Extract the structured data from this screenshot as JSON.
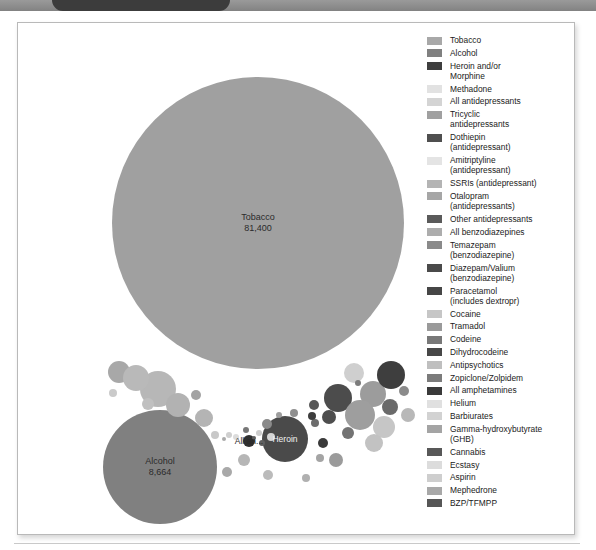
{
  "window": {
    "tab_name": "",
    "toolbar_color": "#8d8d8d",
    "tab_color": "#3c3c3c"
  },
  "figure": {
    "background": "#ffffff",
    "border_color": "#b9b9b9"
  },
  "chart_data": {
    "type": "bubble",
    "title": "",
    "subtitle": "",
    "xlabel": "",
    "ylabel": "",
    "grid": false,
    "legend_position": "right",
    "value_unit": "deaths",
    "labelled_bubbles": [
      {
        "name": "Tobacco",
        "value": 81400,
        "value_text": "81,400",
        "label_text": "Tobacco\n81,400"
      },
      {
        "name": "Alcohol",
        "value": 8664,
        "value_text": "8,664",
        "label_text": "Alcohol\n8,664"
      },
      {
        "name": "Heroin and/or Morphine",
        "value": null,
        "value_text": "",
        "label_text": "Heroin"
      },
      {
        "name": "All antidepressants",
        "value": null,
        "value_text": "",
        "label_text": "All an..."
      }
    ],
    "series": [
      {
        "name": "Tobacco",
        "value": 81400,
        "color": "#a0a0a0"
      },
      {
        "name": "Alcohol",
        "value": 8664,
        "color": "#808080"
      },
      {
        "name": "Heroin and/or Morphine",
        "value": null,
        "color": "#4a4a4a"
      },
      {
        "name": "Methadone",
        "value": null,
        "color": "#dcdcdc"
      },
      {
        "name": "All antidepressants",
        "value": null,
        "color": "#d2d2d2"
      },
      {
        "name": "Tricyclic antidepressants",
        "value": null,
        "color": "#9c9c9c"
      },
      {
        "name": "Dothiepin (antidepressant)",
        "value": null,
        "color": "#555555"
      },
      {
        "name": "Amitriptyline (antidepressant)",
        "value": null,
        "color": "#e0e0e0"
      },
      {
        "name": "SSRIs (antidepressant)",
        "value": null,
        "color": "#b0b0b0"
      },
      {
        "name": "Otalopram (antidepressants)",
        "value": null,
        "color": "#a8a8a8"
      },
      {
        "name": "Other antidepressants",
        "value": null,
        "color": "#5e5e5e"
      },
      {
        "name": "All benzodiazepines",
        "value": null,
        "color": "#a5a5a5"
      },
      {
        "name": "Temazepam (benzodiazepine)",
        "value": null,
        "color": "#8c8c8c"
      },
      {
        "name": "Diazepam/Valium (benzodiazepine)",
        "value": null,
        "color": "#4f4f4f"
      },
      {
        "name": "Paracetamol (includes dextropr)",
        "value": null,
        "color": "#4b4b4b"
      },
      {
        "name": "Cocaine",
        "value": null,
        "color": "#c4c4c4"
      },
      {
        "name": "Tramadol",
        "value": null,
        "color": "#9a9a9a"
      },
      {
        "name": "Codeine",
        "value": null,
        "color": "#7a7a7a"
      },
      {
        "name": "Dihydrocodeine",
        "value": null,
        "color": "#4d4d4d"
      },
      {
        "name": "Antipsychotics",
        "value": null,
        "color": "#bdbdbd"
      },
      {
        "name": "Zopiclone/Zolpidem",
        "value": null,
        "color": "#7e7e7e"
      },
      {
        "name": "All amphetamines",
        "value": null,
        "color": "#3f3f3f"
      },
      {
        "name": "Helium",
        "value": null,
        "color": "#dedede"
      },
      {
        "name": "Barbiurates",
        "value": null,
        "color": "#d0d0d0"
      },
      {
        "name": "Gamma-hydroxybutyrate (GHB)",
        "value": null,
        "color": "#a2a2a2"
      },
      {
        "name": "Cannabis",
        "value": null,
        "color": "#5c5c5c"
      },
      {
        "name": "Ecstasy",
        "value": null,
        "color": "#dadada"
      },
      {
        "name": "Aspirin",
        "value": null,
        "color": "#cccccc"
      },
      {
        "name": "Mephedrone",
        "value": null,
        "color": "#a6a6a6"
      },
      {
        "name": "BZP/TFMPP",
        "value": null,
        "color": "#5a5a5a"
      }
    ],
    "bubbles": [
      {
        "name": "Tobacco",
        "cx": 240,
        "cy": 200,
        "r": 146,
        "color": "#a0a0a0"
      },
      {
        "name": "Alcohol",
        "cx": 142,
        "cy": 444,
        "r": 57,
        "color": "#808080"
      },
      {
        "name": "Heroin and/or Morphine",
        "cx": 267,
        "cy": 416,
        "r": 23,
        "color": "#4a4a4a"
      },
      {
        "name": "Methadone",
        "cx": 140,
        "cy": 366,
        "r": 18,
        "color": "#b7b7b7"
      },
      {
        "name": "All antidepressants",
        "cx": 231,
        "cy": 418,
        "r": 6,
        "color": "#2f2f2f"
      },
      {
        "name": "Tricyclic antidepressants",
        "cx": 101,
        "cy": 349,
        "r": 11,
        "color": "#a8a8a8"
      },
      {
        "name": "Dothiepin",
        "cx": 320,
        "cy": 375,
        "r": 14,
        "color": "#4c4c4c"
      },
      {
        "name": "Amitriptyline",
        "cx": 336,
        "cy": 350,
        "r": 10,
        "color": "#cfcfcf"
      },
      {
        "name": "SSRIs",
        "cx": 355,
        "cy": 371,
        "r": 13,
        "color": "#9c9c9c"
      },
      {
        "name": "Otalopram",
        "cx": 373,
        "cy": 352,
        "r": 14,
        "color": "#3e3e3e"
      },
      {
        "name": "Other antidepressants",
        "cx": 372,
        "cy": 384,
        "r": 8,
        "color": "#6a6a6a"
      },
      {
        "name": "All benzodiazepines",
        "cx": 118,
        "cy": 355,
        "r": 13,
        "color": "#b9b9b9"
      },
      {
        "name": "Temazepam",
        "cx": 160,
        "cy": 382,
        "r": 12,
        "color": "#b2b2b2"
      },
      {
        "name": "Diazepam/Valium",
        "cx": 296,
        "cy": 382,
        "r": 5,
        "color": "#575757"
      },
      {
        "name": "Paracetamol",
        "cx": 311,
        "cy": 394,
        "r": 7,
        "color": "#4e4e4e"
      },
      {
        "name": "Cocaine",
        "cx": 342,
        "cy": 392,
        "r": 15,
        "color": "#9e9e9e"
      },
      {
        "name": "Tramadol",
        "cx": 297,
        "cy": 400,
        "r": 4,
        "color": "#6d6d6d"
      },
      {
        "name": "Codeine",
        "cx": 249,
        "cy": 401,
        "r": 5,
        "color": "#8a8a8a"
      },
      {
        "name": "Dihydrocodeine",
        "cx": 305,
        "cy": 420,
        "r": 5,
        "color": "#3a3a3a"
      },
      {
        "name": "Antipsychotics",
        "cx": 366,
        "cy": 404,
        "r": 11,
        "color": "#c6c6c6"
      },
      {
        "name": "Zopiclone/Zolpidem",
        "cx": 228,
        "cy": 407,
        "r": 3,
        "color": "#777777"
      },
      {
        "name": "All amphetamines",
        "cx": 294,
        "cy": 393,
        "r": 4,
        "color": "#3d3d3d"
      },
      {
        "name": "Helium",
        "cx": 253,
        "cy": 414,
        "r": 4,
        "color": "#d5d5d5"
      },
      {
        "name": "Barbiurates",
        "cx": 241,
        "cy": 410,
        "r": 3,
        "color": "#cdcdcd"
      },
      {
        "name": "GHB",
        "cx": 302,
        "cy": 435,
        "r": 4,
        "color": "#a4a4a4"
      },
      {
        "name": "Cannabis",
        "cx": 244,
        "cy": 420,
        "r": 3,
        "color": "#5f5f5f"
      },
      {
        "name": "Ecstasy",
        "cx": 218,
        "cy": 414,
        "r": 3,
        "color": "#dcdcdc"
      },
      {
        "name": "Aspirin",
        "cx": 211,
        "cy": 412,
        "r": 3,
        "color": "#cfcfcf"
      },
      {
        "name": "Mephedrone",
        "cx": 206,
        "cy": 416,
        "r": 2,
        "color": "#aaaaaa"
      },
      {
        "name": "BZP/TFMPP",
        "cx": 236,
        "cy": 415,
        "r": 2,
        "color": "#5d5d5d"
      },
      {
        "name": "extra-a",
        "cx": 197,
        "cy": 412,
        "r": 4,
        "color": "#c8c8c8"
      },
      {
        "name": "extra-b",
        "cx": 186,
        "cy": 395,
        "r": 9,
        "color": "#b4b4b4"
      },
      {
        "name": "extra-c",
        "cx": 276,
        "cy": 390,
        "r": 4,
        "color": "#8f8f8f"
      },
      {
        "name": "extra-d",
        "cx": 330,
        "cy": 410,
        "r": 6,
        "color": "#737373"
      },
      {
        "name": "extra-e",
        "cx": 356,
        "cy": 420,
        "r": 9,
        "color": "#c2c2c2"
      },
      {
        "name": "extra-f",
        "cx": 318,
        "cy": 437,
        "r": 7,
        "color": "#9b9b9b"
      },
      {
        "name": "extra-g",
        "cx": 226,
        "cy": 437,
        "r": 6,
        "color": "#b6b6b6"
      },
      {
        "name": "extra-h",
        "cx": 209,
        "cy": 449,
        "r": 5,
        "color": "#a9a9a9"
      },
      {
        "name": "extra-i",
        "cx": 250,
        "cy": 452,
        "r": 5,
        "color": "#bbbbbb"
      },
      {
        "name": "extra-j",
        "cx": 390,
        "cy": 392,
        "r": 7,
        "color": "#b8b8b8"
      },
      {
        "name": "extra-k",
        "cx": 386,
        "cy": 368,
        "r": 5,
        "color": "#8b8b8b"
      },
      {
        "name": "extra-l",
        "cx": 130,
        "cy": 381,
        "r": 6,
        "color": "#c0c0c0"
      },
      {
        "name": "extra-m",
        "cx": 178,
        "cy": 372,
        "r": 5,
        "color": "#a3a3a3"
      },
      {
        "name": "extra-n",
        "cx": 95,
        "cy": 370,
        "r": 4,
        "color": "#cacaca"
      },
      {
        "name": "extra-o",
        "cx": 288,
        "cy": 455,
        "r": 4,
        "color": "#b0b0b0"
      },
      {
        "name": "extra-p",
        "cx": 340,
        "cy": 360,
        "r": 3,
        "color": "#7c7c7c"
      },
      {
        "name": "extra-q",
        "cx": 261,
        "cy": 392,
        "r": 3,
        "color": "#9d9d9d"
      }
    ]
  },
  "legend": {
    "items": [
      {
        "label": "Tobacco",
        "color": "#a8a8a8"
      },
      {
        "label": "Alcohol",
        "color": "#808080"
      },
      {
        "label": "Heroin and/or\nMorphine",
        "color": "#3e3e3e"
      },
      {
        "label": "Methadone",
        "color": "#e2e2e2"
      },
      {
        "label": "All antidepressants",
        "color": "#d4d4d4"
      },
      {
        "label": "Tricyclic\nantidepressants",
        "color": "#a0a0a0"
      },
      {
        "label": "Dothiepin\n(antidepressant)",
        "color": "#4f4f4f"
      },
      {
        "label": "Amitriptyline\n(antidepressant)",
        "color": "#e4e4e4"
      },
      {
        "label": "SSRIs (antidepressant)",
        "color": "#b4b4b4"
      },
      {
        "label": "Otalopram\n(antidepressants)",
        "color": "#a6a6a6"
      },
      {
        "label": "Other antidepressants",
        "color": "#5a5a5a"
      },
      {
        "label": "All benzodiazepines",
        "color": "#adadad"
      },
      {
        "label": "Temazepam\n(benzodiazepine)",
        "color": "#8a8a8a"
      },
      {
        "label": "Diazepam/Valium\n(benzodiazepine)",
        "color": "#4a4a4a"
      },
      {
        "label": "Paracetamol\n(includes dextropr)",
        "color": "#464646"
      },
      {
        "label": "Cocaine",
        "color": "#c6c6c6"
      },
      {
        "label": "Tramadol",
        "color": "#9a9a9a"
      },
      {
        "label": "Codeine",
        "color": "#787878"
      },
      {
        "label": "Dihydrocodeine",
        "color": "#474747"
      },
      {
        "label": "Antipsychotics",
        "color": "#bfbfbf"
      },
      {
        "label": "Zopiclone/Zolpidem",
        "color": "#7b7b7b"
      },
      {
        "label": "All amphetamines",
        "color": "#3a3a3a"
      },
      {
        "label": "Helium",
        "color": "#e0e0e0"
      },
      {
        "label": "Barbiurates",
        "color": "#d2d2d2"
      },
      {
        "label": "Gamma-hydroxybutyrate\n(GHB)",
        "color": "#a4a4a4"
      },
      {
        "label": "Cannabis",
        "color": "#585858"
      },
      {
        "label": "Ecstasy",
        "color": "#dcdcdc"
      },
      {
        "label": "Aspirin",
        "color": "#cecece"
      },
      {
        "label": "Mephedrone",
        "color": "#a8a8a8"
      },
      {
        "label": "BZP/TFMPP",
        "color": "#565656"
      }
    ]
  }
}
